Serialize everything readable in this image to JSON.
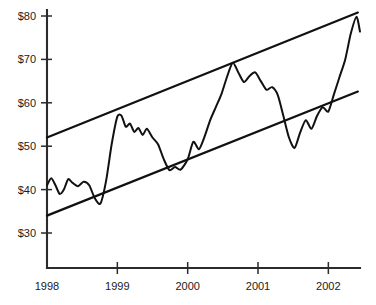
{
  "chart_data": {
    "type": "line",
    "title": "",
    "xlabel": "",
    "ylabel": "",
    "grid": false,
    "legend": null,
    "xlim": [
      1998.0,
      2002.45
    ],
    "ylim": [
      25.0,
      81.5
    ],
    "y_ticks": [
      30,
      40,
      50,
      60,
      70,
      80
    ],
    "y_tick_labels": [
      "$30",
      "$40",
      "$50",
      "$60",
      "$70",
      "$80"
    ],
    "x_ticks": [
      1998,
      1999,
      2000,
      2001,
      2002
    ],
    "x_tick_labels": [
      "1998",
      "1999",
      "2000",
      "2001",
      "2002"
    ],
    "annotations": [
      "ascending parallel channel drawn over the price series",
      "price oscillates between lower support line and upper resistance line"
    ],
    "series": [
      {
        "name": "Price",
        "type": "line",
        "color": "#111111",
        "x": [
          1998.0,
          1998.06,
          1998.12,
          1998.18,
          1998.24,
          1998.3,
          1998.36,
          1998.44,
          1998.52,
          1998.6,
          1998.68,
          1998.76,
          1998.84,
          1998.92,
          1999.0,
          1999.06,
          1999.12,
          1999.18,
          1999.24,
          1999.3,
          1999.36,
          1999.42,
          1999.5,
          1999.58,
          1999.66,
          1999.74,
          1999.82,
          1999.9,
          2000.0,
          2000.08,
          2000.16,
          2000.24,
          2000.32,
          2000.4,
          2000.48,
          2000.56,
          2000.64,
          2000.72,
          2000.8,
          2000.88,
          2000.96,
          2001.04,
          2001.12,
          2001.2,
          2001.28,
          2001.36,
          2001.44,
          2001.52,
          2001.6,
          2001.68,
          2001.76,
          2001.84,
          2001.92,
          2002.0,
          2002.08,
          2002.16,
          2002.24,
          2002.32,
          2002.4,
          2002.45
        ],
        "y": [
          41.0,
          42.6,
          41.0,
          39.0,
          40.0,
          42.4,
          41.6,
          40.8,
          41.8,
          41.0,
          38.0,
          36.8,
          42.0,
          50.5,
          56.8,
          57.0,
          54.5,
          55.2,
          53.3,
          54.2,
          52.6,
          54.0,
          52.0,
          50.4,
          47.0,
          44.5,
          45.2,
          44.6,
          47.0,
          51.0,
          49.3,
          52.2,
          56.0,
          59.0,
          62.0,
          66.0,
          69.2,
          67.0,
          64.8,
          66.2,
          67.0,
          65.0,
          63.0,
          63.6,
          61.8,
          57.0,
          52.0,
          49.6,
          53.2,
          56.0,
          54.0,
          57.0,
          59.0,
          58.0,
          62.0,
          66.0,
          70.0,
          76.0,
          79.8,
          76.4
        ]
      },
      {
        "name": "Upper resistance line",
        "type": "trendline",
        "color": "#111111",
        "x": [
          1998.0,
          2002.42
        ],
        "y": [
          52.0,
          80.8
        ]
      },
      {
        "name": "Lower support line",
        "type": "trendline",
        "color": "#111111",
        "x": [
          1998.0,
          2002.42
        ],
        "y": [
          34.0,
          62.6
        ]
      }
    ]
  },
  "axes": {
    "y_axis_name": "price-axis",
    "x_axis_name": "year-axis"
  }
}
